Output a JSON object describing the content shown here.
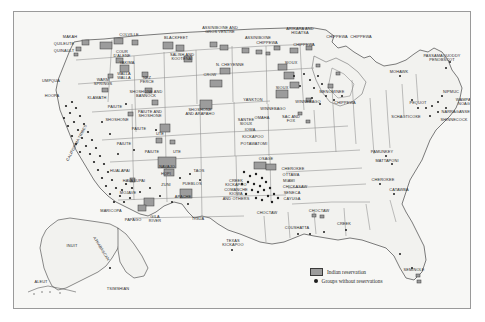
{
  "figure": {
    "background_color": "#f7f7f5",
    "border_color": "#9a9a9a",
    "land_fill": "#f2f2ef",
    "state_line_color": "#8b8b8b",
    "coast_line_color": "#5a5a5a",
    "reservation_fill": "#9c9c9c",
    "reservation_stroke": "#3a3a3a",
    "group_dot_color": "#1d1d1d",
    "label_color": "#2a2a2a"
  },
  "legend": {
    "items": [
      {
        "symbol": "reservation-swatch",
        "label": "Indian reservation"
      },
      {
        "symbol": "group-dot",
        "label": "Groups without reservations"
      }
    ]
  },
  "labels": [
    {
      "text": "MAKAH",
      "x": 56,
      "y": 25,
      "rot": "none"
    },
    {
      "text": "QUILEUTE",
      "x": 50,
      "y": 32,
      "rot": "none"
    },
    {
      "text": "QUINAULT",
      "x": 50,
      "y": 39,
      "rot": "none"
    },
    {
      "text": "COLVILLE",
      "x": 115,
      "y": 23,
      "rot": "none"
    },
    {
      "text": "COUR\nD'ALENE",
      "x": 108,
      "y": 42,
      "rot": "none"
    },
    {
      "text": "YAKIMA",
      "x": 113,
      "y": 51,
      "rot": "none"
    },
    {
      "text": "BLACKFEET",
      "x": 162,
      "y": 26,
      "rot": "none"
    },
    {
      "text": "ASSINIBOINE AND\nGROS VENTRE",
      "x": 206,
      "y": 18,
      "rot": "none"
    },
    {
      "text": "ASSINIBOINE",
      "x": 244,
      "y": 26,
      "rot": "none"
    },
    {
      "text": "ARIKARA AND\nHIDATSA",
      "x": 286,
      "y": 19,
      "rot": "none"
    },
    {
      "text": "CHIPPEWA",
      "x": 323,
      "y": 25,
      "rot": "none"
    },
    {
      "text": "CHIPPEWA",
      "x": 253,
      "y": 31,
      "rot": "none"
    },
    {
      "text": "CHIPPEWA",
      "x": 290,
      "y": 33,
      "rot": "none"
    },
    {
      "text": "CHIPPEWA",
      "x": 347,
      "y": 25,
      "rot": "none"
    },
    {
      "text": "SALISH AND\nKOOTENAI",
      "x": 168,
      "y": 45,
      "rot": "none"
    },
    {
      "text": "N. CHEYENNE",
      "x": 216,
      "y": 53,
      "rot": "none"
    },
    {
      "text": "SIOUX",
      "x": 277,
      "y": 51,
      "rot": "none"
    },
    {
      "text": "SIOUX",
      "x": 268,
      "y": 76,
      "rot": "none"
    },
    {
      "text": "CROW",
      "x": 196,
      "y": 63,
      "rot": "none"
    },
    {
      "text": "WALLA\nWALLA",
      "x": 110,
      "y": 64,
      "rot": "none"
    },
    {
      "text": "NEZ\nPERCE",
      "x": 133,
      "y": 68,
      "rot": "none"
    },
    {
      "text": "WARM\nSPRINGS",
      "x": 89,
      "y": 70,
      "rot": "none"
    },
    {
      "text": "UMPQUA",
      "x": 37,
      "y": 69,
      "rot": "none"
    },
    {
      "text": "HOOPA",
      "x": 38,
      "y": 84,
      "rot": "none"
    },
    {
      "text": "KLAMATH",
      "x": 83,
      "y": 86,
      "rot": "none"
    },
    {
      "text": "SHOSHONE AND\nBANNOCK",
      "x": 132,
      "y": 82,
      "rot": "none"
    },
    {
      "text": "PAIUTE AND\nSHOSHONE",
      "x": 136,
      "y": 102,
      "rot": "none"
    },
    {
      "text": "SHOSHONE\nAND ARAPAHO",
      "x": 186,
      "y": 100,
      "rot": "none"
    },
    {
      "text": "PAIUTE",
      "x": 101,
      "y": 95,
      "rot": "none"
    },
    {
      "text": "SHOSHONE",
      "x": 103,
      "y": 108,
      "rot": "none"
    },
    {
      "text": "PAIUTE",
      "x": 125,
      "y": 117,
      "rot": "none"
    },
    {
      "text": "UTE",
      "x": 146,
      "y": 122,
      "rot": "none"
    },
    {
      "text": "PAIUTE",
      "x": 110,
      "y": 132,
      "rot": "none"
    },
    {
      "text": "PAIUTE",
      "x": 138,
      "y": 140,
      "rot": "none"
    },
    {
      "text": "UTE",
      "x": 163,
      "y": 140,
      "rot": "none"
    },
    {
      "text": "CALIFORNIA TRIBES",
      "x": 63,
      "y": 131,
      "rot": "ca"
    },
    {
      "text": "HUALAPAI",
      "x": 106,
      "y": 159,
      "rot": "none"
    },
    {
      "text": "HAVASUPAI",
      "x": 120,
      "y": 169,
      "rot": "none"
    },
    {
      "text": "MOJAVE",
      "x": 114,
      "y": 181,
      "rot": "none"
    },
    {
      "text": "NAVAJO",
      "x": 153,
      "y": 155,
      "rot": "none"
    },
    {
      "text": "HOPI",
      "x": 152,
      "y": 162,
      "rot": "none"
    },
    {
      "text": "ZUNI",
      "x": 152,
      "y": 173,
      "rot": "none"
    },
    {
      "text": "PUEBLOS",
      "x": 178,
      "y": 172,
      "rot": "none"
    },
    {
      "text": "TAOS",
      "x": 185,
      "y": 159,
      "rot": "none"
    },
    {
      "text": "APACHE",
      "x": 169,
      "y": 185,
      "rot": "none"
    },
    {
      "text": "MARICOPA",
      "x": 97,
      "y": 199,
      "rot": "none"
    },
    {
      "text": "PAPAGO",
      "x": 119,
      "y": 208,
      "rot": "none"
    },
    {
      "text": "GILA\nRIVER",
      "x": 141,
      "y": 207,
      "rot": "none"
    },
    {
      "text": "TIGUA",
      "x": 184,
      "y": 207,
      "rot": "none"
    },
    {
      "text": "CREEK\nKICKAPOO\nCOMANCHE\nKIOWA\nAND OTHERS",
      "x": 222,
      "y": 178,
      "rot": "none"
    },
    {
      "text": "TEXAS\nKICKAPOO",
      "x": 219,
      "y": 231,
      "rot": "none"
    },
    {
      "text": "YANKTON",
      "x": 239,
      "y": 88,
      "rot": "none"
    },
    {
      "text": "SANTEE\nSIOUX",
      "x": 232,
      "y": 110,
      "rot": "none"
    },
    {
      "text": "WINNEBAGO",
      "x": 259,
      "y": 97,
      "rot": "none"
    },
    {
      "text": "OMAHA",
      "x": 248,
      "y": 106,
      "rot": "none"
    },
    {
      "text": "SAC AND\nFOX",
      "x": 277,
      "y": 107,
      "rot": "none"
    },
    {
      "text": "IOWA",
      "x": 236,
      "y": 118,
      "rot": "none"
    },
    {
      "text": "KICKAPOO",
      "x": 239,
      "y": 125,
      "rot": "none"
    },
    {
      "text": "POTAWATOMI",
      "x": 240,
      "y": 132,
      "rot": "none"
    },
    {
      "text": "OSAGE",
      "x": 252,
      "y": 147,
      "rot": "none"
    },
    {
      "text": "WINNEBAGO",
      "x": 294,
      "y": 90,
      "rot": "none"
    },
    {
      "text": "MENOMINEE",
      "x": 318,
      "y": 80,
      "rot": "none"
    },
    {
      "text": "CHIPPEWA",
      "x": 331,
      "y": 91,
      "rot": "none"
    },
    {
      "text": "MOHAWK",
      "x": 385,
      "y": 60,
      "rot": "none"
    },
    {
      "text": "PASSAMAQUODDY\nPENOBSCOT",
      "x": 428,
      "y": 46,
      "rot": "none"
    },
    {
      "text": "NIPMUC",
      "x": 437,
      "y": 80,
      "rot": "none"
    },
    {
      "text": "WAMPA-\nNOAG",
      "x": 450,
      "y": 90,
      "rot": "none"
    },
    {
      "text": "NARRAGANSET",
      "x": 443,
      "y": 100,
      "rot": "none"
    },
    {
      "text": "SHINNECOCK",
      "x": 440,
      "y": 108,
      "rot": "none"
    },
    {
      "text": "PEQUOT",
      "x": 404,
      "y": 91,
      "rot": "none"
    },
    {
      "text": "SCHAGTICOKE",
      "x": 392,
      "y": 105,
      "rot": "none"
    },
    {
      "text": "PAMUNKEY",
      "x": 368,
      "y": 140,
      "rot": "none"
    },
    {
      "text": "MATTAPONI",
      "x": 373,
      "y": 149,
      "rot": "none"
    },
    {
      "text": "CHEROKEE",
      "x": 369,
      "y": 168,
      "rot": "none"
    },
    {
      "text": "CATAWBA",
      "x": 385,
      "y": 178,
      "rot": "none"
    },
    {
      "text": "CHEROKEE",
      "x": 279,
      "y": 157,
      "rot": "none"
    },
    {
      "text": "OTTAWA",
      "x": 277,
      "y": 163,
      "rot": "none"
    },
    {
      "text": "MIAMI",
      "x": 275,
      "y": 169,
      "rot": "none"
    },
    {
      "text": "CHICKASAW",
      "x": 281,
      "y": 175,
      "rot": "none"
    },
    {
      "text": "SENECA",
      "x": 278,
      "y": 181,
      "rot": "none"
    },
    {
      "text": "CAYUGA",
      "x": 278,
      "y": 187,
      "rot": "none"
    },
    {
      "text": "CHOCTAW",
      "x": 253,
      "y": 201,
      "rot": "none"
    },
    {
      "text": "CHOCTAW",
      "x": 305,
      "y": 199,
      "rot": "none"
    },
    {
      "text": "CREEK",
      "x": 330,
      "y": 212,
      "rot": "none"
    },
    {
      "text": "COUSHATTA",
      "x": 283,
      "y": 216,
      "rot": "none"
    },
    {
      "text": "SEMINOLE",
      "x": 400,
      "y": 258,
      "rot": "none"
    },
    {
      "text": "INUIT",
      "x": 58,
      "y": 234,
      "rot": "none"
    },
    {
      "text": "ATHABASCAN",
      "x": 87,
      "y": 237,
      "rot": "ak"
    },
    {
      "text": "ALEUT",
      "x": 27,
      "y": 270,
      "rot": "none"
    },
    {
      "text": "TSIMSHIAN",
      "x": 104,
      "y": 277,
      "rot": "none"
    }
  ]
}
